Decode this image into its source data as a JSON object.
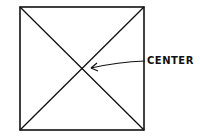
{
  "diagram": {
    "type": "square-with-diagonals",
    "square": {
      "x": 20,
      "y": 7,
      "width": 124,
      "height": 123
    },
    "stroke_color": "#111111",
    "center_point": {
      "x": 82,
      "y": 69
    },
    "arrow": {
      "from": {
        "x": 145,
        "y": 61
      },
      "to": {
        "x": 90,
        "y": 68
      }
    },
    "annotation": {
      "label": "CENTER",
      "x": 147,
      "y": 55
    }
  }
}
